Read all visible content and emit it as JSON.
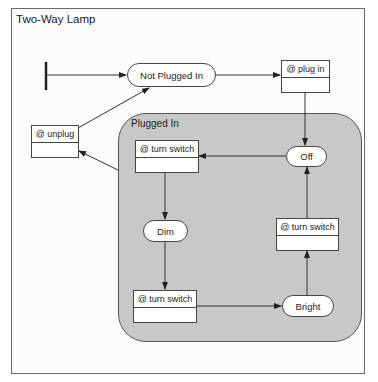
{
  "diagram": {
    "title": "Two-Way Lamp",
    "composite_state": {
      "label": "Plugged In"
    },
    "states": {
      "not_plugged_in": "Not Plugged In",
      "off": "Off",
      "dim": "Dim",
      "bright": "Bright"
    },
    "activities": {
      "plug_in": "@ plug in",
      "unplug": "@ unplug",
      "turn_switch_top": "@ turn switch",
      "turn_switch_bottom": "@ turn switch",
      "turn_switch_right": "@ turn switch"
    },
    "transitions": [
      {
        "from": "initial",
        "to": "Not Plugged In"
      },
      {
        "from": "Not Plugged In",
        "to": "@ plug in"
      },
      {
        "from": "@ plug in",
        "to": "Off"
      },
      {
        "from": "Off",
        "to": "@ turn switch"
      },
      {
        "from": "@ turn switch",
        "to": "Dim"
      },
      {
        "from": "Dim",
        "to": "@ turn switch"
      },
      {
        "from": "@ turn switch",
        "to": "Bright"
      },
      {
        "from": "Bright",
        "to": "@ turn switch"
      },
      {
        "from": "@ turn switch",
        "to": "Off"
      },
      {
        "from": "Plugged In",
        "to": "@ unplug"
      },
      {
        "from": "@ unplug",
        "to": "Not Plugged In"
      }
    ],
    "colors": {
      "region_fill": "#c8c8c8",
      "stroke": "#444444",
      "background": "#ffffff"
    }
  }
}
